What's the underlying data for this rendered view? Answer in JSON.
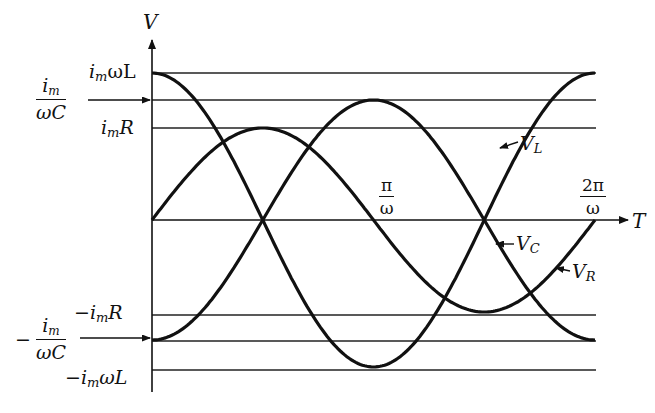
{
  "diagram": {
    "axes": {
      "y_label": "V",
      "x_label": "T"
    },
    "y_levels": [
      {
        "id": "pos_L",
        "label": "i_mωL",
        "text_main": "i",
        "text_sub": "m",
        "text_rest": "ωL",
        "y": 73
      },
      {
        "id": "pos_C",
        "label": "i_m/(ωC)",
        "num_main": "i",
        "num_sub": "m",
        "den": "ωC",
        "y": 100
      },
      {
        "id": "pos_R",
        "label": "i_mR",
        "text_main": "i",
        "text_sub": "m",
        "text_rest": "R",
        "y": 128
      },
      {
        "id": "neg_R",
        "label": "−i_mR",
        "text_main": "−i",
        "text_sub": "m",
        "text_rest": "R",
        "y": 315
      },
      {
        "id": "neg_C",
        "label": "−i_m/(ωC)",
        "prefix": "−",
        "num_main": "i",
        "num_sub": "m",
        "den": "ωC",
        "y": 341
      },
      {
        "id": "neg_L",
        "label": "−i_mωL",
        "text_main": "−i",
        "text_sub": "m",
        "text_rest": "ωL",
        "y": 370
      }
    ],
    "x_ticks": [
      {
        "label": "π/ω",
        "num": "π",
        "den": "ω"
      },
      {
        "label": "2π/ω",
        "num": "2π",
        "den": "ω"
      }
    ],
    "curves": [
      {
        "name": "V_L",
        "main": "V",
        "sub": "L",
        "shape": "cosine",
        "amplitude_label": "i_mωL"
      },
      {
        "name": "V_C",
        "main": "V",
        "sub": "C",
        "shape": "-cosine",
        "amplitude_label": "i_m/(ωC)"
      },
      {
        "name": "V_R",
        "main": "V",
        "sub": "R",
        "shape": "sine",
        "amplitude_label": "i_mR"
      }
    ],
    "colors": {
      "ink": "#111111",
      "background": "#ffffff"
    }
  }
}
